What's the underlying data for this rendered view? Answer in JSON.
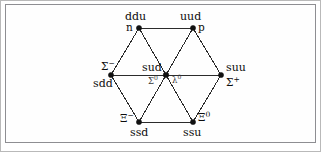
{
  "figure": {
    "name": "baryon-octet-diagram",
    "type": "diagram",
    "background_color": "#ffffff",
    "border_color": "#8e8e92",
    "line_color": "#2b2b2b",
    "vertex_color": "#111111"
  },
  "nodes": [
    {
      "id": "neutron",
      "quark_content": "ddu",
      "particle": "n",
      "x": 139,
      "y": 28
    },
    {
      "id": "proton",
      "quark_content": "uud",
      "particle": "p",
      "x": 193,
      "y": 28
    },
    {
      "id": "sigma-minus",
      "quark_content": "sdd",
      "particle": "Σ",
      "charge": "−",
      "x": 111,
      "y": 75
    },
    {
      "id": "sigma-zero-lambda-zero",
      "quark_content": "sud",
      "particle": "Σ",
      "charge": "0",
      "particle_alt": "Λ",
      "charge_alt": "0",
      "x": 166,
      "y": 75
    },
    {
      "id": "sigma-plus",
      "quark_content": "suu",
      "particle": "Σ",
      "charge": "+",
      "x": 221,
      "y": 75
    },
    {
      "id": "xi-minus",
      "quark_content": "ssd",
      "particle": "Ξ",
      "charge": "−",
      "x": 139,
      "y": 122
    },
    {
      "id": "xi-zero",
      "quark_content": "ssu",
      "particle": "Ξ",
      "charge": "0",
      "x": 193,
      "y": 122
    }
  ],
  "labels": {
    "ddu": "ddu",
    "uud": "uud",
    "sud": "sud",
    "sdd": "sdd",
    "suu": "suu",
    "ssd": "ssd",
    "ssu": "ssu",
    "n": "n",
    "p": "p",
    "sigma_minus": "Σ",
    "sigma_minus_sup": "−",
    "sigma_zero": "Σ",
    "sigma_zero_sup": "0",
    "lambda_zero": "λ",
    "lambda_zero_sup": "0",
    "sigma_plus": "Σ",
    "sigma_plus_sup": "+",
    "xi_minus": "Ξ",
    "xi_minus_sup": "−",
    "xi_zero": "Ξ",
    "xi_zero_sup": "0"
  },
  "edges": [
    {
      "from": "neutron",
      "to": "proton"
    },
    {
      "from": "neutron",
      "to": "sigma-minus"
    },
    {
      "from": "proton",
      "to": "sigma-plus"
    },
    {
      "from": "sigma-minus",
      "to": "xi-minus"
    },
    {
      "from": "sigma-plus",
      "to": "xi-zero"
    },
    {
      "from": "xi-minus",
      "to": "xi-zero"
    },
    {
      "from": "sigma-minus",
      "to": "sigma-zero-lambda-zero"
    },
    {
      "from": "sigma-zero-lambda-zero",
      "to": "sigma-plus"
    },
    {
      "from": "neutron",
      "to": "sigma-zero-lambda-zero"
    },
    {
      "from": "proton",
      "to": "sigma-zero-lambda-zero"
    },
    {
      "from": "sigma-zero-lambda-zero",
      "to": "xi-minus"
    },
    {
      "from": "sigma-zero-lambda-zero",
      "to": "xi-zero"
    }
  ]
}
